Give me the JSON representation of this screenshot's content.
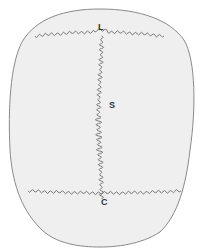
{
  "figure": {
    "labels": {
      "top": "L",
      "middle": "S",
      "bottom": "C"
    },
    "colors": {
      "background": "#ffffff",
      "skull_fill": "#efefef",
      "outline": "#8a8a8a",
      "suture": "#6e6e6e",
      "label": "#333333"
    }
  }
}
